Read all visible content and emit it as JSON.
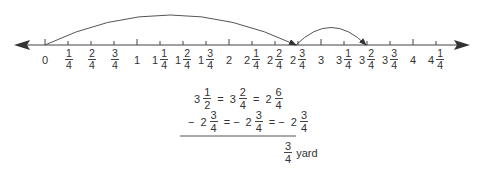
{
  "number_line": {
    "min": 0,
    "max": 4.25,
    "step": 0.25,
    "axis_color": "#444444",
    "ticks": [
      {
        "value": 0,
        "whole": "0",
        "num": "",
        "den": ""
      },
      {
        "value": 0.25,
        "whole": "",
        "num": "1",
        "den": "4"
      },
      {
        "value": 0.5,
        "whole": "",
        "num": "2",
        "den": "4"
      },
      {
        "value": 0.75,
        "whole": "",
        "num": "3",
        "den": "4"
      },
      {
        "value": 1,
        "whole": "1",
        "num": "",
        "den": ""
      },
      {
        "value": 1.25,
        "whole": "1",
        "num": "1",
        "den": "4"
      },
      {
        "value": 1.5,
        "whole": "1",
        "num": "2",
        "den": "4"
      },
      {
        "value": 1.75,
        "whole": "1",
        "num": "3",
        "den": "4"
      },
      {
        "value": 2,
        "whole": "2",
        "num": "",
        "den": ""
      },
      {
        "value": 2.25,
        "whole": "2",
        "num": "1",
        "den": "4"
      },
      {
        "value": 2.5,
        "whole": "2",
        "num": "2",
        "den": "4"
      },
      {
        "value": 2.75,
        "whole": "2",
        "num": "3",
        "den": "4"
      },
      {
        "value": 3,
        "whole": "3",
        "num": "",
        "den": ""
      },
      {
        "value": 3.25,
        "whole": "3",
        "num": "1",
        "den": "4"
      },
      {
        "value": 3.5,
        "whole": "3",
        "num": "2",
        "den": "4"
      },
      {
        "value": 3.75,
        "whole": "3",
        "num": "3",
        "den": "4"
      },
      {
        "value": 4,
        "whole": "4",
        "num": "",
        "den": ""
      },
      {
        "value": 4.25,
        "whole": "4",
        "num": "1",
        "den": "4"
      }
    ],
    "jumps": [
      {
        "from": 0,
        "to": 2.75,
        "description": "jump from 0 to 2 3/4"
      },
      {
        "from": 2.75,
        "to": 3.5,
        "description": "jump from 2 3/4 to 3 2/4"
      }
    ]
  },
  "equations": {
    "row1": [
      {
        "whole": "3",
        "num": "1",
        "den": "2"
      },
      {
        "op": "="
      },
      {
        "whole": "3",
        "num": "2",
        "den": "4"
      },
      {
        "op": "="
      },
      {
        "whole": "2",
        "num": "6",
        "den": "4"
      }
    ],
    "row2": [
      {
        "op": "−"
      },
      {
        "whole": "2",
        "num": "3",
        "den": "4"
      },
      {
        "op": "= −"
      },
      {
        "whole": "2",
        "num": "3",
        "den": "4"
      },
      {
        "op": "= −"
      },
      {
        "whole": "2",
        "num": "3",
        "den": "4"
      }
    ],
    "result": {
      "num": "3",
      "den": "4",
      "unit": "yard"
    }
  }
}
